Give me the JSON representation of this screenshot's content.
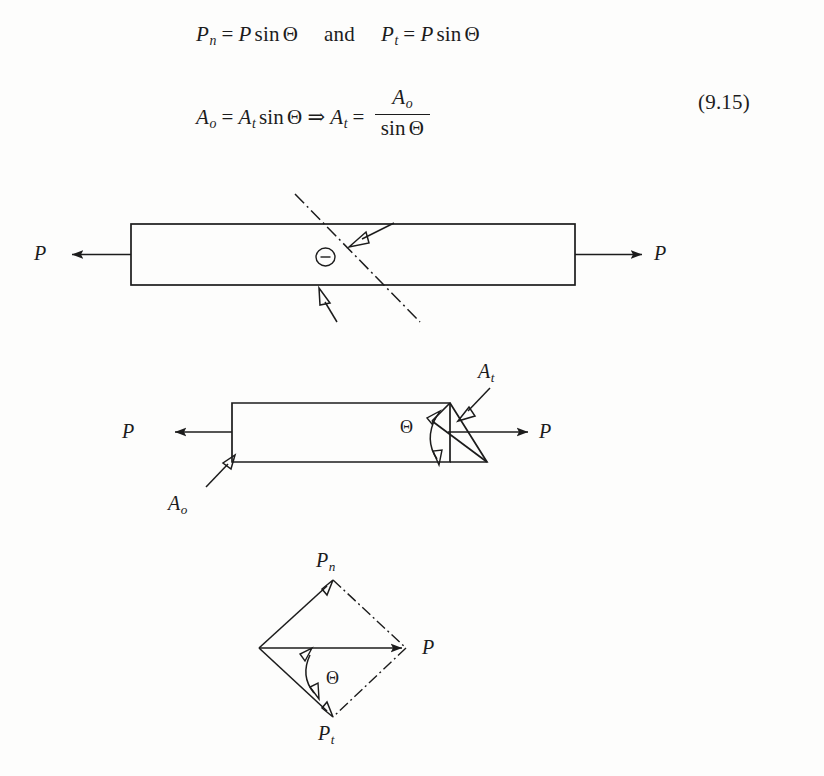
{
  "document": {
    "kind": "textbook-figure-page",
    "equation_number": "(9.15)"
  },
  "equations": [
    {
      "id": "eq-normal-tangential-forces",
      "parts": [
        {
          "lhs_base": "P",
          "lhs_sub": "n",
          "rel": "=",
          "rhs": "P sin Θ"
        },
        {
          "conjunction": "and"
        },
        {
          "lhs_base": "P",
          "lhs_sub": "t",
          "rel": "=",
          "rhs": "P sin Θ"
        }
      ],
      "tokens": {
        "P": "P",
        "sub_n": "n",
        "sub_t": "t",
        "equals": "=",
        "sin": "sin",
        "theta": "Θ",
        "and": "and"
      }
    },
    {
      "id": "eq-area-relation",
      "tokens": {
        "A": "A",
        "sub_o": "o",
        "sub_t": "t",
        "equals": "=",
        "implies": "⇒",
        "sin": "sin",
        "theta": "Θ"
      }
    }
  ],
  "figures": [
    {
      "id": "fig-bar-with-inclined-plane",
      "name": "prismatic-bar-inclined-section",
      "labels": {
        "force_left": "P",
        "force_right": "P",
        "angle": "Θ"
      },
      "annotations": {
        "section_line_style": "dash-dot",
        "leader_arrow_count": 2
      }
    },
    {
      "id": "fig-wedge-areas",
      "name": "bar-with-oblique-cut-showing-areas",
      "labels": {
        "force_left": "P",
        "force_right": "P",
        "angle": "Θ",
        "area_original": "A",
        "area_original_sub": "o",
        "area_inclined": "A",
        "area_inclined_sub": "t"
      }
    },
    {
      "id": "fig-force-parallelogram",
      "name": "force-resolution-parallelogram",
      "labels": {
        "normal_force": "P",
        "normal_force_sub": "n",
        "tangential_force": "P",
        "tangential_force_sub": "t",
        "resultant_force": "P",
        "angle": "Θ"
      },
      "annotations": {
        "construction_line_style": "dash-dot",
        "shape": "rhombus"
      }
    }
  ],
  "colors": {
    "ink": "#1c1c1c",
    "paper": "#fdfdfc",
    "faint": "#c9c7c2"
  }
}
